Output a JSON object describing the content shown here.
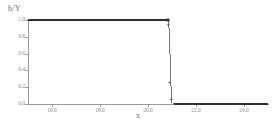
{
  "chart_data": {
    "type": "line",
    "title": "",
    "ylabel": "b/Y",
    "xlabel": "X",
    "xlim": [
      15.0,
      25.0
    ],
    "ylim": [
      0.0,
      1.0
    ],
    "grid": false,
    "legend": "none",
    "xticks": [
      "16.0",
      "18.0",
      "20.0",
      "22.0",
      "24.0"
    ],
    "xtick_values": [
      16.0,
      18.0,
      20.0,
      22.0,
      24.0
    ],
    "yticks": [
      "1.0",
      "0.8",
      "0.6",
      "0.4",
      "0.2",
      "0.0"
    ],
    "ytick_values": [
      1.0,
      0.8,
      0.6,
      0.4,
      0.2,
      0.0
    ],
    "series": [
      {
        "name": "b/Y",
        "x": [
          15.0,
          16.0,
          17.0,
          18.0,
          19.0,
          20.0,
          20.6,
          20.8,
          20.85,
          20.9,
          20.95,
          21.0,
          21.1,
          22.0,
          23.0,
          24.0,
          25.0
        ],
        "values": [
          1.0,
          1.0,
          1.0,
          1.0,
          1.0,
          1.0,
          1.0,
          1.0,
          0.9,
          0.6,
          0.22,
          0.01,
          0.0,
          0.0,
          0.0,
          0.0,
          0.0
        ]
      }
    ],
    "markers": [
      {
        "x": 20.83,
        "y": 1.0,
        "style": "square"
      },
      {
        "x": 20.88,
        "y": 0.9,
        "style": "plus"
      },
      {
        "x": 20.93,
        "y": 0.22,
        "style": "plus"
      },
      {
        "x": 21.0,
        "y": 0.01,
        "style": "plus"
      }
    ],
    "annotation": "step function dropping from 1.0 to 0.0 near x = 20.9"
  }
}
